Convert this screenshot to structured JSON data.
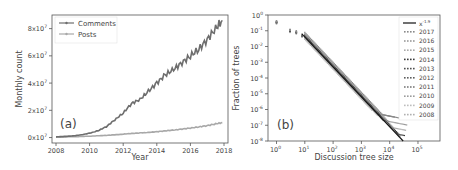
{
  "chart_data": [
    {
      "type": "line",
      "panel_label": "(a)",
      "title": "",
      "xlabel": "Year",
      "ylabel": "Monthly count",
      "xlim": [
        2008,
        2018
      ],
      "ylim": [
        -4000000.0,
        90000000.0
      ],
      "xticks": [
        2008,
        2010,
        2012,
        2014,
        2016,
        2018
      ],
      "xtick_labels": [
        "2008",
        "2010",
        "2012",
        "2014",
        "2016",
        "2018"
      ],
      "yticks": [
        0,
        20000000.0,
        40000000.0,
        60000000.0,
        80000000.0
      ],
      "ytick_labels": [
        "0x10",
        "2x10",
        "4x10",
        "6x10",
        "8x10"
      ],
      "ytick_exponent": "7",
      "grid": false,
      "legend_position": "upper left",
      "x": [
        2008.0,
        2008.5,
        2009.0,
        2009.5,
        2010.0,
        2010.5,
        2011.0,
        2011.5,
        2012.0,
        2012.5,
        2013.0,
        2013.5,
        2014.0,
        2014.5,
        2015.0,
        2015.5,
        2016.0,
        2016.5,
        2017.0,
        2017.5,
        2017.9
      ],
      "series": [
        {
          "name": "Comments",
          "color": "#6e6e6e",
          "values": [
            500000.0,
            800000.0,
            1200000.0,
            2000000.0,
            3200000.0,
            5000000.0,
            8000000.0,
            13000000.0,
            18000000.0,
            25000000.0,
            28000000.0,
            34000000.0,
            40000000.0,
            46000000.0,
            50000000.0,
            55000000.0,
            60000000.0,
            65000000.0,
            72000000.0,
            80000000.0,
            86000000.0
          ]
        },
        {
          "name": "Posts",
          "color": "#a8a8a8",
          "values": [
            300000.0,
            400000.0,
            600000.0,
            800000.0,
            1000000.0,
            1300000.0,
            1600000.0,
            2000000.0,
            2500000.0,
            3000000.0,
            3400000.0,
            3800000.0,
            4300000.0,
            4900000.0,
            5500000.0,
            6200000.0,
            7000000.0,
            7800000.0,
            8800000.0,
            10000000.0,
            11000000.0
          ]
        }
      ]
    },
    {
      "type": "scatter",
      "panel_label": "(b)",
      "title": "",
      "xlabel": "Discussion tree size",
      "ylabel": "Fraction of trees",
      "xscale": "log",
      "yscale": "log",
      "xlim": [
        0.5,
        600000
      ],
      "ylim": [
        1e-08,
        1
      ],
      "xticks": [
        1,
        10,
        100,
        1000,
        10000,
        100000
      ],
      "xtick_exponents": [
        "0",
        "1",
        "2",
        "3",
        "4",
        "5"
      ],
      "yticks": [
        1,
        0.1,
        0.01,
        0.001,
        0.0001,
        1e-05,
        1e-06,
        1e-07,
        1e-08
      ],
      "ytick_exponents": [
        "0",
        "-1",
        "-2",
        "-3",
        "-4",
        "-5",
        "-6",
        "-7",
        "-8"
      ],
      "grid": false,
      "legend_position": "upper right",
      "fit_line": {
        "label": "x",
        "exponent": "-1.9",
        "slope": -1.9,
        "x_range": [
          8,
          30000
        ],
        "y_at_8": 0.06,
        "color": "#111111"
      },
      "series": [
        {
          "name": "2017",
          "color": "#8a8a8a"
        },
        {
          "name": "2016",
          "color": "#9a9a9a"
        },
        {
          "name": "2015",
          "color": "#aaaaaa"
        },
        {
          "name": "2014",
          "color": "#3a3a3a"
        },
        {
          "name": "2013",
          "color": "#4e4e4e"
        },
        {
          "name": "2012",
          "color": "#5e5e5e"
        },
        {
          "name": "2011",
          "color": "#7a7a7a"
        },
        {
          "name": "2010",
          "color": "#9c9c9c"
        },
        {
          "name": "2009",
          "color": "#bdbdbd"
        },
        {
          "name": "2008",
          "color": "#b0b0b0"
        }
      ],
      "points_summary": {
        "x1": 0.35,
        "x3": 0.1,
        "x5": 0.08,
        "x10": 0.04,
        "x100": 0.0008,
        "x1000": 1e-05,
        "tail_min_x": 1000,
        "tail_max_x": 150000
      }
    }
  ]
}
